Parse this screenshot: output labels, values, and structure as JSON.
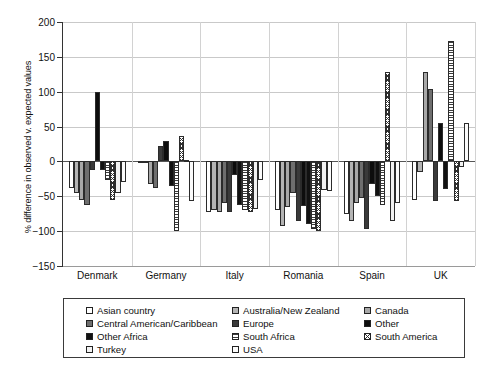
{
  "chart_data": {
    "type": "bar",
    "title": "",
    "xlabel": "",
    "ylabel": "% difference in observed v. expected values",
    "ylim": [
      -150,
      200
    ],
    "yticks": [
      200,
      150,
      100,
      50,
      0,
      -50,
      -100,
      -150
    ],
    "grid": true,
    "legend_position": "bottom",
    "categories": [
      "Denmark",
      "Germany",
      "Italy",
      "Romania",
      "Spain",
      "UK"
    ],
    "series": [
      {
        "name": "Asian country",
        "key": "asian",
        "values": [
          -38,
          0,
          -72,
          -70,
          -75,
          -55
        ]
      },
      {
        "name": "Australia/New Zealand",
        "key": "aus",
        "values": [
          -45,
          0,
          -70,
          -93,
          -86,
          -15
        ]
      },
      {
        "name": "Canada",
        "key": "canada",
        "values": [
          -56,
          -32,
          -72,
          -66,
          -60,
          128
        ]
      },
      {
        "name": "Central American/Caribbean",
        "key": "cac",
        "values": [
          -62,
          -38,
          -60,
          -45,
          -52,
          104
        ]
      },
      {
        "name": "Europe",
        "key": "europe",
        "values": [
          -13,
          22,
          -72,
          -85,
          -97,
          -57
        ]
      },
      {
        "name": "Other",
        "key": "other",
        "values": [
          100,
          29,
          -20,
          -64,
          -33,
          55
        ]
      },
      {
        "name": "Other Africa",
        "key": "otherafr",
        "values": [
          -13,
          -35,
          -63,
          -90,
          -50,
          -40
        ]
      },
      {
        "name": "South Africa",
        "key": "sthafr",
        "values": [
          -26,
          -100,
          -70,
          -97,
          -63,
          173
        ]
      },
      {
        "name": "South America",
        "key": "sthamer",
        "values": [
          -56,
          37,
          -73,
          -100,
          128,
          -57
        ]
      },
      {
        "name": "Turkey",
        "key": "turkey",
        "values": [
          -45,
          2,
          -68,
          -41,
          -86,
          -8
        ]
      },
      {
        "name": "USA",
        "key": "usa",
        "values": [
          -30,
          -57,
          -27,
          -43,
          -60,
          55
        ]
      }
    ]
  },
  "axis": {
    "y_title": "% difference in observed v. expected values",
    "y_ticks": [
      "200",
      "150",
      "100",
      "50",
      "0",
      "−50",
      "−100",
      "−150"
    ],
    "x_ticks": [
      "Denmark",
      "Germany",
      "Italy",
      "Romania",
      "Spain",
      "UK"
    ]
  },
  "legend": {
    "items": [
      {
        "label": "Asian country",
        "swatch": "asian"
      },
      {
        "label": "Australia/New Zealand",
        "swatch": "aus"
      },
      {
        "label": "Canada",
        "swatch": "canada"
      },
      {
        "label": "Central American/Caribbean",
        "swatch": "cac"
      },
      {
        "label": "Europe",
        "swatch": "europe"
      },
      {
        "label": "Other",
        "swatch": "other"
      },
      {
        "label": "Other Africa",
        "swatch": "otherafr"
      },
      {
        "label": "South Africa",
        "swatch": "sthafr"
      },
      {
        "label": "South America",
        "swatch": "sthamer"
      },
      {
        "label": "Turkey",
        "swatch": "turkey"
      },
      {
        "label": "USA",
        "swatch": "usa"
      }
    ]
  }
}
